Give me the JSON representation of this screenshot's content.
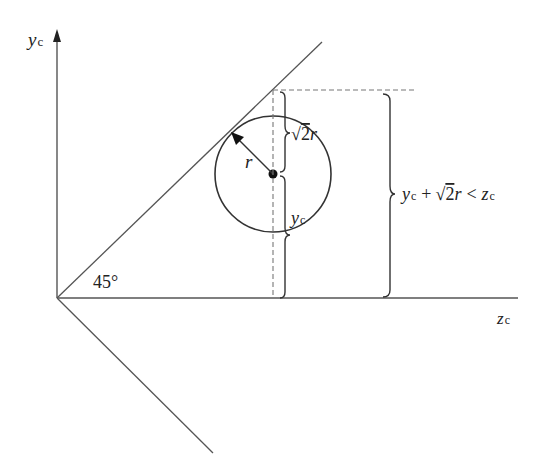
{
  "diagram": {
    "axes": {
      "y_label_main": "y",
      "y_label_sub": "c",
      "z_label_main": "z",
      "z_label_sub": "c"
    },
    "angle_label": "45°",
    "radius_label": "r",
    "brace_upper_label": {
      "sqrt": "√",
      "radicand": "2",
      "var": "r"
    },
    "brace_lower_label": {
      "main": "y",
      "sub": "c"
    },
    "condition_label": {
      "y": "y",
      "y_sub": "c",
      "plus": "+",
      "sqrt": "√",
      "radicand": "2",
      "r": "r",
      "lt": "<",
      "z": "z",
      "z_sub": "c"
    },
    "colors": {
      "line": "#555555",
      "text": "#222222",
      "dashed": "#777777"
    }
  }
}
